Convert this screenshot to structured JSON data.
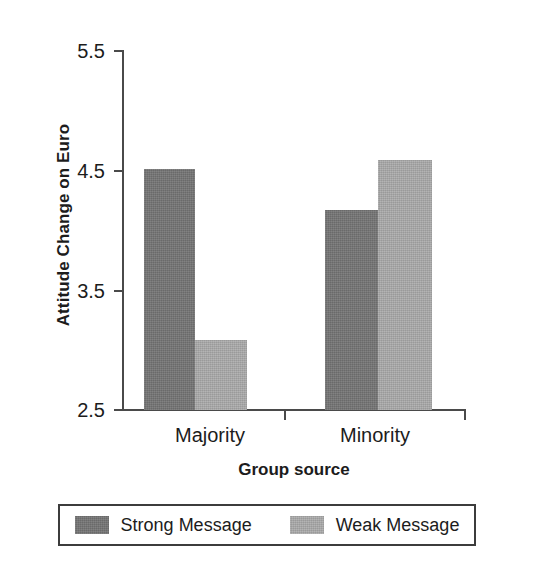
{
  "chart_data": {
    "type": "bar",
    "title": "",
    "xlabel": "Group source",
    "ylabel": "Attitude Change on Euro",
    "categories": [
      "Majority",
      "Minority"
    ],
    "series": [
      {
        "name": "Strong Message",
        "color": "#757575",
        "values": [
          4.51,
          4.17
        ]
      },
      {
        "name": "Weak Message",
        "color": "#a9a9a9",
        "values": [
          3.08,
          4.58
        ]
      }
    ],
    "ylim": [
      2.5,
      5.5
    ],
    "yticks": [
      "2.5",
      "3.5",
      "4.5",
      "5.5"
    ],
    "ytick_values": [
      2.5,
      3.5,
      4.5,
      5.5
    ],
    "grid": false,
    "legend_position": "bottom",
    "axis_color": "#4a4a4a"
  },
  "legend": {
    "items": [
      {
        "label": "Strong Message",
        "swatch": "dark"
      },
      {
        "label": "Weak Message",
        "swatch": "light"
      }
    ]
  }
}
